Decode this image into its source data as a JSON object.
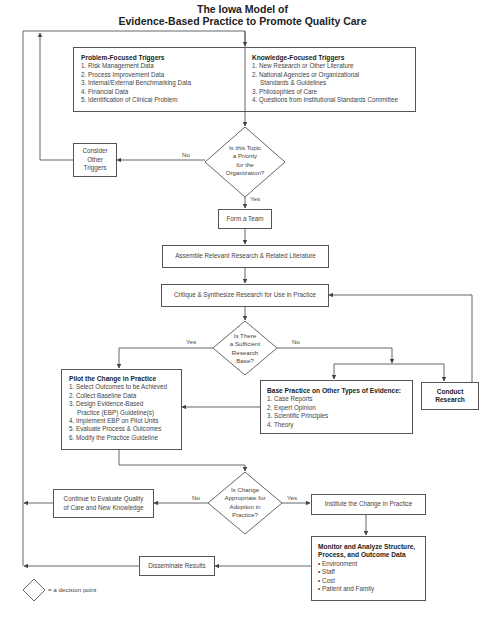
{
  "title": {
    "line1": "The Iowa Model of",
    "line2": "Evidence-Based Practice to Promote Quality Care"
  },
  "triggers": {
    "problem": {
      "heading": "Problem-Focused Triggers",
      "items": [
        "1. Risk Management Data",
        "2. Process Improvement Data",
        "3. Internal/External Benchmarking Data",
        "4. Financial Data",
        "5. Identification of Clinical Problem"
      ]
    },
    "knowledge": {
      "heading": "Knowledge-Focused Triggers",
      "items": [
        "1. New Research or Other Literature",
        "2. National Agencies or Organizational",
        "Standards & Guidelines",
        "3. Philosophies of Care",
        "4. Questions from Institutional Standards Committee"
      ]
    }
  },
  "decision1": {
    "lines": [
      "Is this Topic",
      "a Priority",
      "for the",
      "Organization?"
    ],
    "no_label": "No",
    "yes_label": "Yes"
  },
  "consider_other_triggers": {
    "lines": [
      "Consider",
      "Other",
      "Triggers"
    ]
  },
  "form_team": {
    "label": "Form a Team"
  },
  "assemble": {
    "label": "Assemble Relevant Research & Related Literature"
  },
  "critique": {
    "label": "Critique & Synthesize Research for Use in Practice"
  },
  "decision2": {
    "lines": [
      "Is There",
      "a Sufficient",
      "Research",
      "Base?"
    ],
    "yes_label": "Yes",
    "no_label": "No"
  },
  "pilot": {
    "heading": "Pilot the Change in Practice",
    "items": [
      "1. Select Outcomes to be Achieved",
      "2. Collect Baseline Data",
      "3. Design Evidence-Based",
      "Practice (EBP) Guideline(s)",
      "4. Implement EBP on Pilot Units",
      "5. Evaluate Process & Outcomes",
      "6. Modify the Practice Guideline"
    ]
  },
  "base_practice": {
    "heading": "Base Practice on Other Types of Evidence:",
    "items": [
      "1. Case Reports",
      "2. Expert Opinion",
      "3. Scientific Principles",
      "4. Theory"
    ]
  },
  "conduct_research": {
    "lines": [
      "Conduct",
      "Research"
    ]
  },
  "decision3": {
    "lines": [
      "Is Change",
      "Appropriate for",
      "Adoption in",
      "Practice?"
    ],
    "no_label": "No",
    "yes_label": "Yes"
  },
  "continue_evaluate": {
    "lines": [
      "Continue to Evaluate Quality",
      "of Care and New Knowledge"
    ]
  },
  "institute": {
    "label": "Institute the Change in Practice"
  },
  "monitor": {
    "heading_lines": [
      "Monitor and Analyze Structure,",
      "Process, and Outcome Data"
    ],
    "items": [
      "• Environment",
      "• Staff",
      "• Cost",
      "• Patient and Family"
    ]
  },
  "disseminate": {
    "label": "Disseminate Results"
  },
  "legend": {
    "label": "= a decision point"
  },
  "colors": {
    "line": "#555555",
    "text": "#444444",
    "heading": "#222222"
  }
}
